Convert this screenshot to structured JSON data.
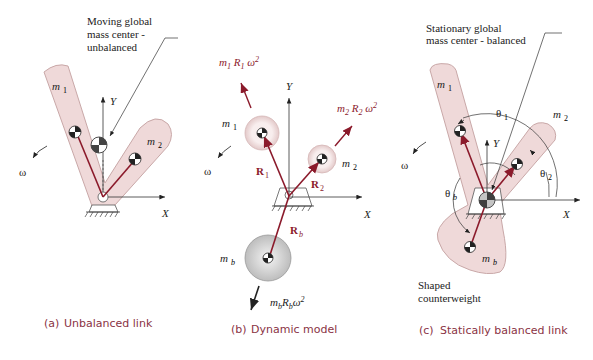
{
  "panels": [
    {
      "id": "a",
      "caption_prefix": "(a)",
      "caption": "Unbalanced link",
      "callout": [
        "Moving global",
        "mass center -",
        "unbalanced"
      ],
      "labels": {
        "m1": "m",
        "m1_sub": "1",
        "m2": "m",
        "m2_sub": "2",
        "Y": "Y",
        "X": "X",
        "omega": "ω"
      }
    },
    {
      "id": "b",
      "caption_prefix": "(b)",
      "caption": "Dynamic model",
      "labels": {
        "m1": "m",
        "m1_sub": "1",
        "m2": "m",
        "m2_sub": "2",
        "mb": "m",
        "mb_sub": "b",
        "R1": "R",
        "R1_sub": "1",
        "R2": "R",
        "R2_sub": "2",
        "Rb": "R",
        "Rb_sub": "b",
        "Y": "Y",
        "X": "X",
        "omega": "ω",
        "force1": "m₁ R₁ ω²",
        "force2": "m₂ R₂ ω²",
        "forceb": "m_b R_b ω²"
      }
    },
    {
      "id": "c",
      "caption_prefix": "(c)",
      "caption": "Statically balanced link",
      "callout": [
        "Stationary global",
        "mass center - balanced"
      ],
      "note": [
        "Shaped",
        "counterweight"
      ],
      "labels": {
        "m1": "m",
        "m1_sub": "1",
        "m2": "m",
        "m2_sub": "2",
        "mb": "m",
        "mb_sub": "b",
        "theta1": "θ",
        "theta1_sub": "1",
        "theta2": "θ",
        "theta2_sub": "2",
        "thetab": "θ",
        "thetab_sub": "b",
        "Y": "Y",
        "X": "X",
        "omega": "ω"
      }
    }
  ],
  "colors": {
    "link_fill": "#efd9d9",
    "link_stroke": "#c9a8a8",
    "vector": "#8b1a2b",
    "caption": "#8a3344",
    "counterweight_disk": "#cfcfcf"
  }
}
